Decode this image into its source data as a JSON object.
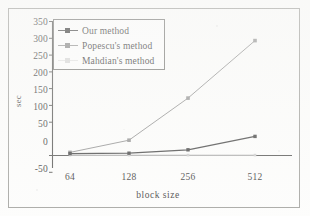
{
  "figure": {
    "y_axis_label": "sec",
    "x_axis_label": "block  size"
  },
  "legend": {
    "entries": [
      {
        "label": "Our method",
        "color": "#3a3a3a"
      },
      {
        "label": "Popescu's method",
        "color": "#8c8c8c"
      },
      {
        "label": "Mahdian's method",
        "color": "#c9c9c9"
      }
    ]
  },
  "chart_data": {
    "type": "line",
    "title": "",
    "xlabel": "block  size",
    "ylabel": "sec",
    "categories": [
      "64",
      "128",
      "256",
      "512"
    ],
    "x_tick_labels": [
      "64",
      "128",
      "256",
      "512"
    ],
    "y_tick_labels": [
      "-50",
      "0",
      "50",
      "100",
      "150",
      "200",
      "250",
      "300",
      "350"
    ],
    "ylim": [
      -50,
      350
    ],
    "y_ticks": [
      -50,
      0,
      50,
      100,
      150,
      200,
      250,
      300,
      350
    ],
    "grid": false,
    "legend_position": "upper left",
    "series": [
      {
        "name": "Our method",
        "values": [
          5,
          6,
          15,
          50
        ],
        "color": "#3a3a3a",
        "marker": "square"
      },
      {
        "name": "Popescu's method",
        "values": [
          8,
          40,
          150,
          300
        ],
        "color": "#8c8c8c",
        "marker": "square"
      },
      {
        "name": "Mahdian's method",
        "values": [
          1,
          1,
          1,
          1
        ],
        "color": "#c9c9c9",
        "marker": "square"
      }
    ]
  }
}
